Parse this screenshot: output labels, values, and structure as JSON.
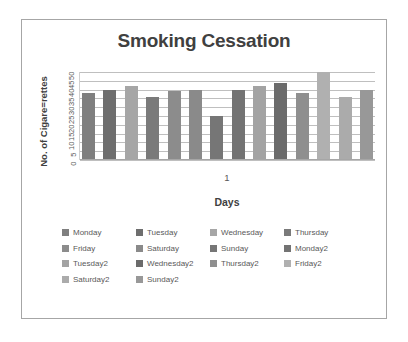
{
  "chart_data": {
    "type": "bar",
    "title": "Smoking Cessation",
    "xlabel": "Days",
    "ylabel": "No. of Cigare=rettes",
    "categories": [
      "1"
    ],
    "ylim": [
      0,
      50
    ],
    "yticks": [
      "50",
      "45",
      "40",
      "35",
      "30",
      "25",
      "20",
      "15",
      "10",
      "5",
      "0"
    ],
    "grid": true,
    "legend_position": "bottom",
    "series": [
      {
        "name": "Monday",
        "values": [
          38
        ],
        "color": "#7f7f7f"
      },
      {
        "name": "Tuesday",
        "values": [
          40
        ],
        "color": "#6e6e6e"
      },
      {
        "name": "Wednesday",
        "values": [
          42
        ],
        "color": "#a6a6a6"
      },
      {
        "name": "Thursday",
        "values": [
          36
        ],
        "color": "#7a7a7a"
      },
      {
        "name": "Friday",
        "values": [
          39
        ],
        "color": "#8c8c8c"
      },
      {
        "name": "Saturday",
        "values": [
          40
        ],
        "color": "#8a8a8a"
      },
      {
        "name": "Sunday",
        "values": [
          25
        ],
        "color": "#767676"
      },
      {
        "name": "Monday2",
        "values": [
          40
        ],
        "color": "#737373"
      },
      {
        "name": "Tuesday2",
        "values": [
          42
        ],
        "color": "#a3a3a3"
      },
      {
        "name": "Wednesday2",
        "values": [
          44
        ],
        "color": "#6b6b6b"
      },
      {
        "name": "Thursday2",
        "values": [
          38
        ],
        "color": "#8f8f8f"
      },
      {
        "name": "Friday2",
        "values": [
          50
        ],
        "color": "#b0b0b0"
      },
      {
        "name": "Saturday2",
        "values": [
          36
        ],
        "color": "#ababab"
      },
      {
        "name": "Sunday2",
        "values": [
          40
        ],
        "color": "#989898"
      }
    ]
  },
  "legend": {
    "rows": [
      [
        {
          "label": "Monday",
          "color": "#7f7f7f"
        },
        {
          "label": "Tuesday",
          "color": "#6e6e6e"
        },
        {
          "label": "Wednesday",
          "color": "#a6a6a6"
        },
        {
          "label": "Thursday",
          "color": "#7a7a7a"
        }
      ],
      [
        {
          "label": "Friday",
          "color": "#8c8c8c"
        },
        {
          "label": "Saturday",
          "color": "#8a8a8a"
        },
        {
          "label": "Sunday",
          "color": "#767676"
        },
        {
          "label": "Monday2",
          "color": "#737373"
        }
      ],
      [
        {
          "label": "Tuesday2",
          "color": "#a3a3a3"
        },
        {
          "label": "Wednesday2",
          "color": "#6b6b6b"
        },
        {
          "label": "Thursday2",
          "color": "#8f8f8f"
        },
        {
          "label": "Friday2",
          "color": "#b0b0b0"
        }
      ],
      [
        {
          "label": "Saturday2",
          "color": "#ababab"
        },
        {
          "label": "Sunday2",
          "color": "#989898"
        }
      ]
    ]
  }
}
